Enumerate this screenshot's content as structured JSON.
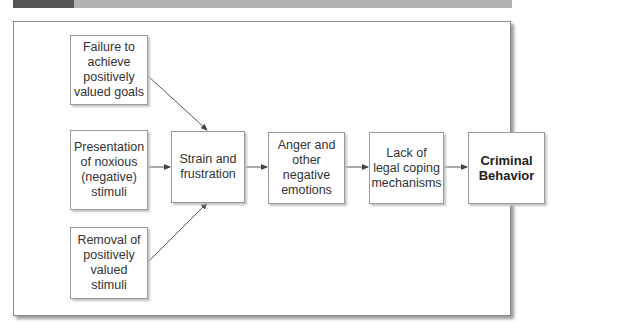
{
  "diagram": {
    "nodes": [
      {
        "id": "failure",
        "label": "Failure to achieve positively valued goals"
      },
      {
        "id": "noxious",
        "label": "Presentation of noxious (negative) stimuli"
      },
      {
        "id": "removal",
        "label": "Removal of positively valued stimuli"
      },
      {
        "id": "strain",
        "label": "Strain and frustration"
      },
      {
        "id": "anger",
        "label": "Anger and other negative emotions"
      },
      {
        "id": "lack",
        "label": "Lack of legal coping mechanisms"
      },
      {
        "id": "criminal",
        "label": "Criminal Behavior"
      }
    ],
    "edges": [
      {
        "from": "failure",
        "to": "strain"
      },
      {
        "from": "noxious",
        "to": "strain"
      },
      {
        "from": "removal",
        "to": "strain"
      },
      {
        "from": "strain",
        "to": "anger"
      },
      {
        "from": "anger",
        "to": "lack"
      },
      {
        "from": "lack",
        "to": "criminal"
      }
    ],
    "colors": {
      "topbar_dark": "#555555",
      "topbar_light": "#b3b3b3",
      "border": "#9a9a9a",
      "text": "#333333",
      "arrow": "#555555"
    }
  }
}
